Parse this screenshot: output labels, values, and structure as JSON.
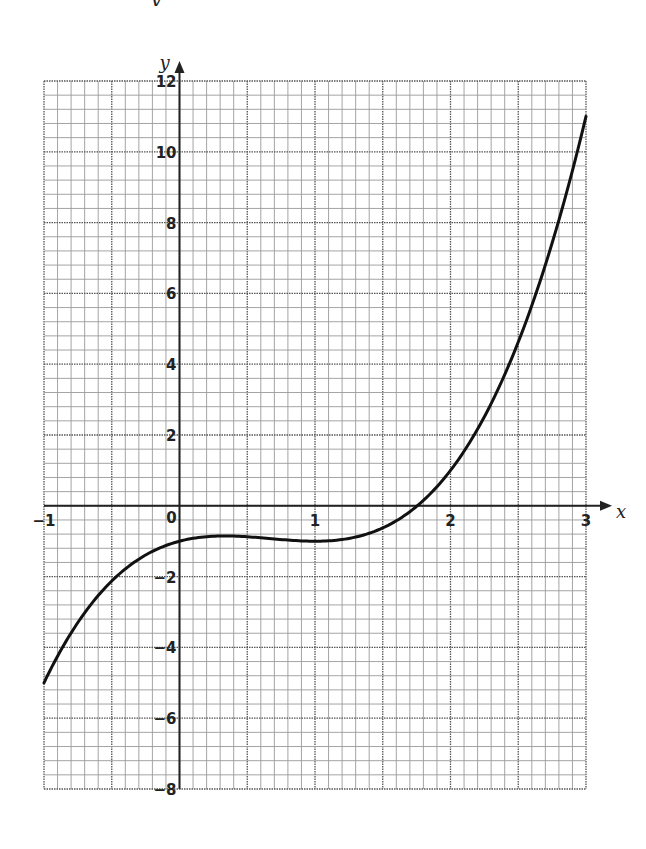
{
  "header": {
    "clipped_title_fragment": "y"
  },
  "chart_data": {
    "type": "line",
    "title": "",
    "xlabel": "x",
    "ylabel": "y",
    "xlim": [
      -1,
      3
    ],
    "ylim": [
      -8,
      12
    ],
    "grid": true,
    "grid_minor_x_step": 0.1,
    "grid_major_x_step": 0.5,
    "grid_minor_y_step": 0.4,
    "grid_major_y_step": 2,
    "x_tick_labels": [
      "−1",
      "0",
      "1",
      "2",
      "3"
    ],
    "x_ticks": [
      -1,
      0,
      1,
      2,
      3
    ],
    "y_tick_labels": [
      "12",
      "10",
      "8",
      "6",
      "4",
      "2",
      "−2",
      "−4",
      "−6",
      "−8"
    ],
    "y_ticks": [
      12,
      10,
      8,
      6,
      4,
      2,
      -2,
      -4,
      -6,
      -8
    ],
    "origin_label": "0",
    "series": [
      {
        "name": "curve",
        "formula_estimate": "y = x^3 - 2x^2 + x - 1",
        "x": [
          -1,
          -0.75,
          -0.5,
          -0.25,
          0,
          0.25,
          0.33,
          0.5,
          0.75,
          1,
          1.25,
          1.5,
          1.75,
          2,
          2.25,
          2.5,
          2.75,
          3
        ],
        "y": [
          -5,
          -3.73,
          -2.13,
          -1.39,
          -1,
          -0.86,
          -0.85,
          -0.88,
          -0.95,
          -1,
          -0.92,
          -0.63,
          -0.02,
          1,
          2.52,
          4.63,
          7.42,
          11
        ]
      }
    ],
    "features": {
      "local_max": [
        0.33,
        -0.85
      ],
      "local_min": [
        1,
        -1
      ],
      "x_intercept": 1.75,
      "y_intercept": -1
    }
  },
  "colors": {
    "curve": "#111111",
    "axis": "#222222",
    "grid_minor": "#9a9a9a",
    "grid_major": "#555555"
  }
}
